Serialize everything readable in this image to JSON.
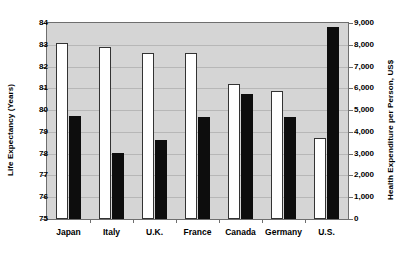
{
  "chart_data": {
    "type": "bar",
    "title": "",
    "subtitle": "",
    "xlabel": "",
    "ylabel": "Life Expectancy (Years)",
    "y2label": "Health Expenditure per Person, US$",
    "grid": true,
    "legend": "none",
    "categories": [
      "Japan",
      "Italy",
      "U.K.",
      "France",
      "Canada",
      "Germany",
      "U.S."
    ],
    "ylim": [
      75,
      84
    ],
    "yticks": [
      "75",
      "76",
      "77",
      "78",
      "79",
      "80",
      "81",
      "82",
      "83",
      "84"
    ],
    "y2lim": [
      0,
      9000
    ],
    "y2ticks": [
      "0",
      "1,000",
      "2,000",
      "3,000",
      "4,000",
      "5,000",
      "6,000",
      "7,000",
      "8,000",
      "9,000"
    ],
    "series": [
      {
        "name": "Life Expectancy (Years)",
        "axis": "left",
        "color": "#ffffff",
        "values": [
          83.1,
          82.9,
          82.6,
          82.6,
          81.2,
          80.9,
          78.7
        ]
      },
      {
        "name": "Health Expenditure per Person, US$",
        "axis": "right",
        "color": "#0d0d0d",
        "values": [
          4750,
          3050,
          3650,
          4700,
          5750,
          4700,
          8800
        ]
      }
    ]
  }
}
